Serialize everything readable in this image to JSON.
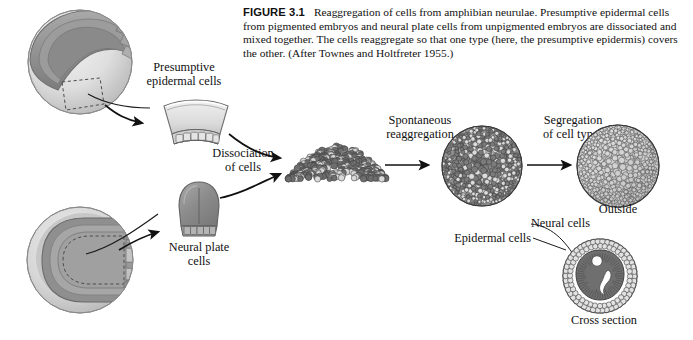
{
  "figure": {
    "number": "FIGURE 3.1",
    "caption": "Reaggregation of cells from amphibian neurulae. Presumptive epidermal cells from pigmented embryos and neural plate cells from unpigmented embryos are dissociated and mixed together. The cells reaggregate so that one type (here, the presumptive epidermis) covers the other. (After Townes and Holtfreter 1955.)"
  },
  "labels": {
    "presumptive_epidermal_cells": "Presumptive\nepidermal cells",
    "presumptive_epidermal_line1": "Presumptive",
    "presumptive_epidermal_line2": "epidermal cells",
    "dissociation_line1": "Dissociation",
    "dissociation_line2": "of cells",
    "neural_plate_line1": "Neural plate",
    "neural_plate_line2": "cells",
    "spontaneous_line1": "Spontaneous",
    "spontaneous_line2": "reaggregation",
    "segregation_line1": "Segregation",
    "segregation_line2": "of cell types",
    "outside": "Outside",
    "neural_cells": "Neural cells",
    "epidermal_cells": "Epidermal cells",
    "cross_section": "Cross section"
  },
  "panels": {
    "top_left_embryo": "pigmented-gastrula-with-excision-site",
    "epidermal_explant": "presumptive-epidermis-explant",
    "bottom_left_embryo": "neurula-with-neural-plate-outline",
    "neural_plate_explant": "neural-plate-explant",
    "cell_mound": "dissociated-mixed-cell-mound",
    "mixed_aggregate": "reaggregated-sphere-mixed-cells",
    "sorted_aggregate": "sorted-sphere-epidermis-outside",
    "cross_section_view": "sorted-aggregate-cross-section"
  },
  "colors": {
    "ink": "#1a1a1a",
    "dark_cell": "#6e6e6e",
    "light_cell": "#d8d8d8",
    "embryo_light": "#dcdcdc",
    "embryo_mid": "#b6b6b6",
    "embryo_dark": "#8e8e8e",
    "outline": "#5a5a5a",
    "white": "#ffffff"
  }
}
